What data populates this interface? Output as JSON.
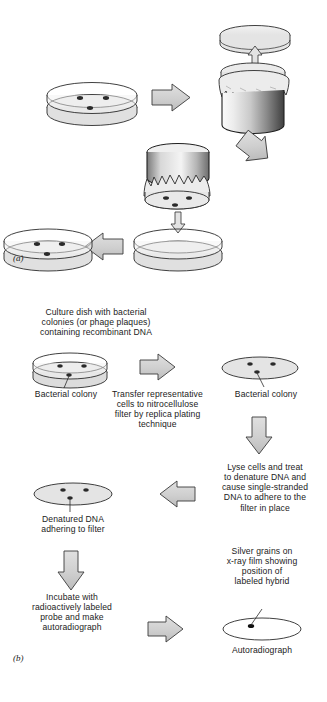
{
  "figure": {
    "panels": [
      {
        "id": "a",
        "label": "(a)"
      },
      {
        "id": "b",
        "label": "(b)"
      }
    ]
  },
  "colors": {
    "arrow_fill": "#d2d2d2",
    "arrow_stroke": "#3a3a3a",
    "dish_fill": "#e2e2e2",
    "dish_stroke": "#2b2b2b",
    "colony_fill": "#2a2a2a",
    "cylinder_light": "#f2f2f2",
    "cylinder_dark": "#4a4a4a",
    "cloth_fill": "#ededed",
    "text": "#1b1b1b",
    "background": "#ffffff"
  },
  "panel_a": {
    "label": "(a)",
    "steps": [
      {
        "name": "culture-dish",
        "colonies": 3
      },
      {
        "name": "replica-block-with-lid",
        "colonies": 3
      },
      {
        "name": "inverted-replica-block",
        "colonies": 3
      },
      {
        "name": "empty-dish",
        "colonies": 0
      },
      {
        "name": "replica-dish",
        "colonies": 3
      }
    ],
    "arrows": [
      {
        "name": "arrow-right-1",
        "direction": "right"
      },
      {
        "name": "arrow-down-lift",
        "direction": "up"
      },
      {
        "name": "arrow-diagonal",
        "direction": "down-left"
      },
      {
        "name": "arrow-down-press",
        "direction": "down"
      },
      {
        "name": "arrow-left-1",
        "direction": "left"
      }
    ]
  },
  "panel_b": {
    "label": "(b)",
    "captions": {
      "culture_dish": "Culture dish with bacterial\ncolonies (or phage plaques)\ncontaining recombinant DNA",
      "bacterial_colony_left": "Bacterial colony",
      "transfer": "Transfer representative\ncells to nitrocellulose\nfilter by replica plating\ntechnique",
      "bacterial_colony_right": "Bacterial colony",
      "lyse": "Lyse cells and treat\nto denature DNA and\ncause single-stranded\nDNA to adhere to the\nfilter in place",
      "denatured": "Denatured DNA\nadhering to filter",
      "incubate": "Incubate with\nradioactively labeled\nprobe and make\nautoradiograph",
      "silver_grains": "Silver grains on\nx-ray film showing\nposition of\nlabeled hybrid",
      "autoradiograph": "Autoradiograph"
    },
    "arrows": [
      {
        "name": "arrow-right-transfer",
        "direction": "right"
      },
      {
        "name": "arrow-down-lyse",
        "direction": "down"
      },
      {
        "name": "arrow-left-denature",
        "direction": "left"
      },
      {
        "name": "arrow-down-incubate",
        "direction": "down"
      },
      {
        "name": "arrow-right-autorad",
        "direction": "right"
      }
    ],
    "objects": [
      {
        "name": "culture-dish",
        "type": "petri-dish",
        "colonies": 3
      },
      {
        "name": "nitrocellulose-filter",
        "type": "flat-disc",
        "colonies": 3
      },
      {
        "name": "denatured-filter",
        "type": "flat-disc",
        "colonies": 3
      },
      {
        "name": "autoradiograph-film",
        "type": "outline-ellipse",
        "spots": 1
      }
    ]
  }
}
